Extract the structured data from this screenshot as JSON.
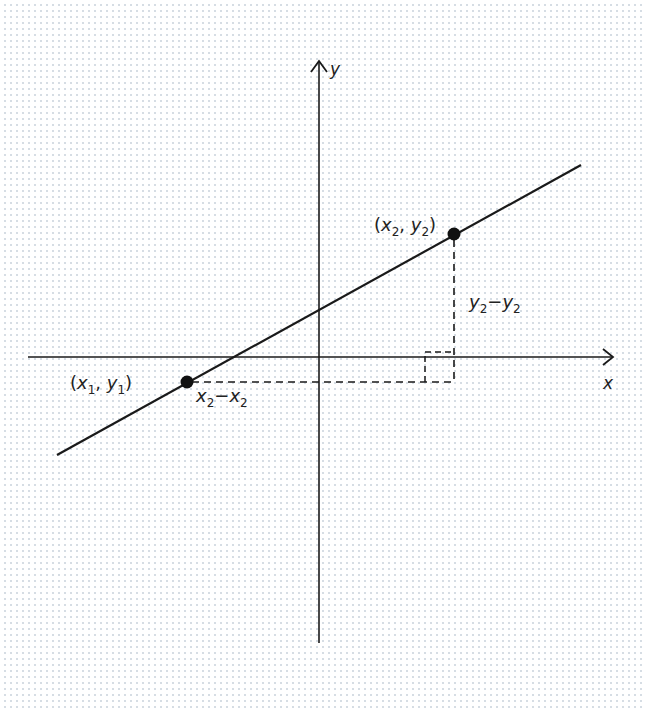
{
  "diagram": {
    "axes": {
      "x_label": "x",
      "y_label": "y"
    },
    "points": [
      {
        "id": "p1",
        "label_base_x": "x",
        "label_sub_x": "1",
        "label_base_y": "y",
        "label_sub_y": "1",
        "cx": 187,
        "cy": 382
      },
      {
        "id": "p2",
        "label_base_x": "x",
        "label_sub_x": "2",
        "label_base_y": "y",
        "label_sub_y": "2",
        "cx": 454,
        "cy": 234
      }
    ],
    "run_label": {
      "a": "x",
      "a_sub": "2",
      "op": "−",
      "b": "x",
      "b_sub": "2"
    },
    "rise_label": {
      "a": "y",
      "a_sub": "2",
      "op": "−",
      "b": "y",
      "b_sub": "2"
    },
    "colors": {
      "line": "#1a1a1a",
      "point": "#111111",
      "background": "#ffffff",
      "dot_grid": "#d6dde4"
    }
  }
}
